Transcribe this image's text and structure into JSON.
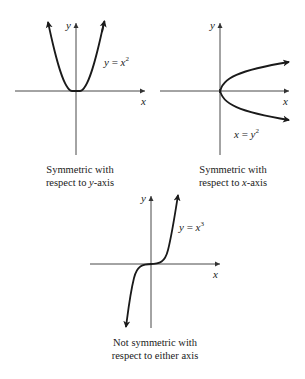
{
  "figure": {
    "panels": [
      {
        "id": "even",
        "equation": {
          "lhs": "y",
          "op": " = ",
          "base": "x",
          "exp": "2"
        },
        "axis_x_label": "x",
        "axis_y_label": "y",
        "caption_line1": "Symmetric with",
        "caption_line2_pre": "respect to ",
        "caption_line2_var": "y",
        "caption_line2_post": "-axis"
      },
      {
        "id": "sideways",
        "equation": {
          "lhs": "x",
          "op": " = ",
          "base": "y",
          "exp": "2"
        },
        "axis_x_label": "x",
        "axis_y_label": "y",
        "caption_line1": "Symmetric with",
        "caption_line2_pre": "respect to ",
        "caption_line2_var": "x",
        "caption_line2_post": "-axis"
      },
      {
        "id": "odd",
        "equation": {
          "lhs": "y",
          "op": " = ",
          "base": "x",
          "exp": "3"
        },
        "axis_x_label": "x",
        "axis_y_label": "y",
        "caption_line1": "Not symmetric with",
        "caption_line2_pre": "respect to either axis",
        "caption_line2_var": "",
        "caption_line2_post": ""
      }
    ],
    "colors": {
      "ink": "#1a1a1a",
      "axis": "#333333",
      "background": "#ffffff"
    }
  }
}
